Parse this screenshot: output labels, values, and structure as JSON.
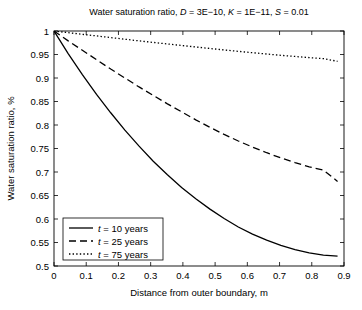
{
  "chart_data": {
    "type": "line",
    "title": "Water saturation ratio, D = 3E−10, K = 1E−11, S = 0.01",
    "title_parts": {
      "prefix": "Water saturation ratio, ",
      "var_d": "D",
      "val_d": " = 3E−10, ",
      "var_k": "K",
      "val_k": " = 1E−11, ",
      "var_s": "S",
      "val_s": " = 0.01"
    },
    "xlabel": "Distance from outer boundary, m",
    "ylabel": "Water saturation ratio, %",
    "xlim": [
      0,
      0.9
    ],
    "ylim": [
      0.5,
      1
    ],
    "xticks": [
      0,
      0.1,
      0.2,
      0.3,
      0.4,
      0.5,
      0.6,
      0.7,
      0.8,
      0.9
    ],
    "xticklabels": [
      "0",
      "0.1",
      "0.2",
      "0.3",
      "0.4",
      "0.5",
      "0.6",
      "0.7",
      "0.8",
      "0.9"
    ],
    "yticks": [
      0.5,
      0.55,
      0.6,
      0.65,
      0.7,
      0.75,
      0.8,
      0.85,
      0.9,
      0.95,
      1
    ],
    "yticklabels": [
      "0.5",
      "0.55",
      "0.6",
      "0.65",
      "0.7",
      "0.75",
      "0.8",
      "0.85",
      "0.9",
      "0.95",
      "1"
    ],
    "grid": false,
    "legend_position": "lower left",
    "x": [
      0,
      0.044,
      0.088,
      0.132,
      0.176,
      0.22,
      0.264,
      0.308,
      0.352,
      0.396,
      0.44,
      0.484,
      0.528,
      0.572,
      0.616,
      0.66,
      0.704,
      0.748,
      0.792,
      0.836,
      0.88
    ],
    "series": [
      {
        "name": "t = 10 years",
        "label_var": "t",
        "label_rest": " = 10 years",
        "style": "solid",
        "color": "#000000",
        "values": [
          1.0,
          0.952,
          0.907,
          0.865,
          0.826,
          0.789,
          0.755,
          0.723,
          0.694,
          0.667,
          0.643,
          0.621,
          0.601,
          0.583,
          0.568,
          0.555,
          0.544,
          0.535,
          0.528,
          0.523,
          0.521
        ]
      },
      {
        "name": "t = 25 years",
        "label_var": "t",
        "label_rest": " = 25 years",
        "style": "dashed",
        "color": "#000000",
        "values": [
          1.0,
          0.979,
          0.959,
          0.939,
          0.919,
          0.9,
          0.881,
          0.863,
          0.845,
          0.828,
          0.811,
          0.795,
          0.78,
          0.766,
          0.753,
          0.741,
          0.73,
          0.72,
          0.711,
          0.704,
          0.68
        ]
      },
      {
        "name": "t = 75 years",
        "label_var": "t",
        "label_rest": " = 75 years",
        "style": "dotted",
        "color": "#000000",
        "values": [
          1.0,
          0.9965,
          0.993,
          0.9895,
          0.986,
          0.9825,
          0.979,
          0.9757,
          0.9724,
          0.9692,
          0.966,
          0.9628,
          0.9597,
          0.9567,
          0.9538,
          0.951,
          0.9483,
          0.9458,
          0.9434,
          0.9412,
          0.9355
        ]
      }
    ]
  }
}
